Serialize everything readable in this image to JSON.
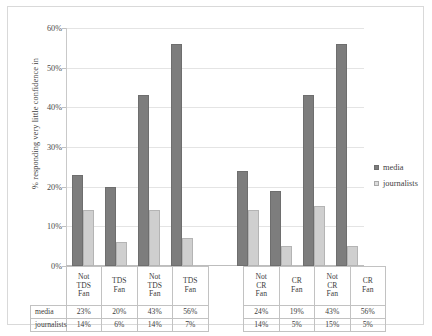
{
  "chart_data": {
    "type": "bar",
    "title": "",
    "xlabel": "",
    "ylabel": "% responding very little confidence in",
    "ylim": [
      0,
      60
    ],
    "ytick_labels": [
      "0%",
      "10%",
      "20%",
      "30%",
      "40%",
      "50%",
      "60%"
    ],
    "ytick_values": [
      0,
      10,
      20,
      30,
      40,
      50,
      60
    ],
    "grid": true,
    "legend_position": "right",
    "categories": [
      "Not TDS Fan",
      "TDS Fan",
      "Not TDS Fan",
      "TDS Fan",
      "",
      "Not CR Fan",
      "CR Fan",
      "Not CR Fan",
      "CR Fan"
    ],
    "category_lines": [
      [
        "Not",
        "TDS",
        "Fan"
      ],
      [
        "TDS",
        "Fan"
      ],
      [
        "Not",
        "TDS",
        "Fan"
      ],
      [
        "TDS",
        "Fan"
      ],
      [],
      [
        "Not",
        "CR",
        "Fan"
      ],
      [
        "CR",
        "Fan"
      ],
      [
        "Not",
        "CR",
        "Fan"
      ],
      [
        "CR",
        "Fan"
      ]
    ],
    "series": [
      {
        "name": "media",
        "color": "#7d7d7d",
        "values": [
          23,
          20,
          43,
          56,
          null,
          24,
          19,
          43,
          56
        ],
        "labels": [
          "23%",
          "20%",
          "43%",
          "56%",
          "",
          "24%",
          "19%",
          "43%",
          "56%"
        ]
      },
      {
        "name": "journalists",
        "color": "#cfcfcf",
        "values": [
          14,
          6,
          14,
          7,
          null,
          14,
          5,
          15,
          5
        ],
        "labels": [
          "14%",
          "6%",
          "14%",
          "7%",
          "",
          "14%",
          "5%",
          "15%",
          "5%"
        ]
      }
    ]
  },
  "legend": {
    "items": [
      {
        "label": "media",
        "swatch": "media-swatch"
      },
      {
        "label": "journalists",
        "swatch": "journalists-swatch"
      }
    ]
  },
  "table": {
    "row_labels": [
      "media",
      "journalists"
    ]
  }
}
